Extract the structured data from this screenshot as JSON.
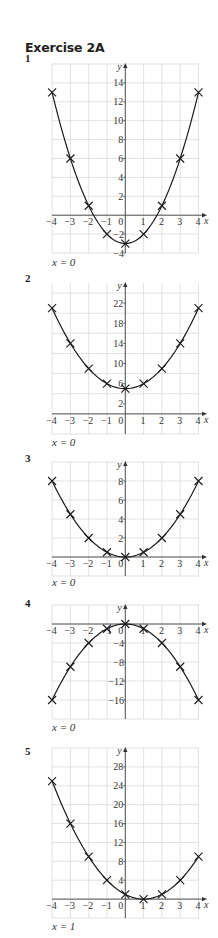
{
  "header": {
    "title": "Exercise 2A"
  },
  "chart_data": [
    {
      "type": "line",
      "number": "1",
      "x": [
        -4,
        -3,
        -2,
        -1,
        0,
        1,
        2,
        3,
        4
      ],
      "values": [
        13,
        6,
        1,
        -2,
        -3,
        -2,
        1,
        6,
        13
      ],
      "xlabel": "x",
      "ylabel": "y",
      "xlim": [
        -4,
        4
      ],
      "ylim": [
        -4,
        16
      ],
      "yticks": [
        -4,
        -2,
        2,
        4,
        6,
        8,
        10,
        12,
        14
      ],
      "xticks": [
        -4,
        -3,
        -2,
        -1,
        0,
        1,
        2,
        3,
        4
      ],
      "grid": true,
      "markers": "x",
      "answer": "x = 0"
    },
    {
      "type": "line",
      "number": "2",
      "x": [
        -4,
        -3,
        -2,
        -1,
        0,
        1,
        2,
        3,
        4
      ],
      "values": [
        21,
        14,
        9,
        6,
        5,
        6,
        9,
        14,
        21
      ],
      "xlabel": "x",
      "ylabel": "y",
      "xlim": [
        -4,
        4
      ],
      "ylim": [
        -4,
        26
      ],
      "yticks": [
        2,
        6,
        10,
        14,
        18,
        22
      ],
      "xticks": [
        -4,
        -3,
        -2,
        -1,
        0,
        1,
        2,
        3,
        4
      ],
      "grid": true,
      "markers": "x",
      "answer": "x = 0"
    },
    {
      "type": "line",
      "number": "3",
      "x": [
        -4,
        -3,
        -2,
        -1,
        0,
        1,
        2,
        3,
        4
      ],
      "values": [
        8,
        4.5,
        2,
        0.5,
        0,
        0.5,
        2,
        4.5,
        8
      ],
      "xlabel": "x",
      "ylabel": "y",
      "xlim": [
        -4,
        4
      ],
      "ylim": [
        -2,
        10
      ],
      "yticks": [
        2,
        4,
        6,
        8
      ],
      "xticks": [
        -4,
        -3,
        -2,
        -1,
        0,
        1,
        2,
        3,
        4
      ],
      "grid": true,
      "markers": "x",
      "answer": "x = 0"
    },
    {
      "type": "line",
      "number": "4",
      "x": [
        -4,
        -3,
        -2,
        -1,
        0,
        1,
        2,
        3,
        4
      ],
      "values": [
        -16,
        -9,
        -4,
        -1,
        0,
        -1,
        -4,
        -9,
        -16
      ],
      "xlabel": "x",
      "ylabel": "y",
      "xlim": [
        -4,
        4
      ],
      "ylim": [
        -20,
        4
      ],
      "yticks": [
        -4,
        -8,
        -12,
        -16
      ],
      "xticks": [
        -4,
        -3,
        -2,
        -1,
        0,
        1,
        2,
        3,
        4
      ],
      "grid": true,
      "markers": "x",
      "answer": "x = 0"
    },
    {
      "type": "line",
      "number": "5",
      "x": [
        -4,
        -3,
        -2,
        -1,
        0,
        1,
        2,
        3,
        4
      ],
      "values": [
        25,
        16,
        9,
        4,
        1,
        0,
        1,
        4,
        9
      ],
      "xlabel": "x",
      "ylabel": "y",
      "xlim": [
        -4,
        4
      ],
      "ylim": [
        -4,
        32
      ],
      "yticks": [
        4,
        8,
        12,
        16,
        20,
        24,
        28
      ],
      "xticks": [
        -4,
        -3,
        -2,
        -1,
        0,
        1,
        2,
        3,
        4
      ],
      "grid": true,
      "markers": "x",
      "answer": "x = 1"
    }
  ],
  "layout": [
    {
      "qnum_top": 52,
      "svg_top": 60,
      "svg_h": 200,
      "grid_top": 64,
      "grid_bottom": 253,
      "y_top_val": 16,
      "y_bot_val": -4,
      "answer_top": 256
    },
    {
      "qnum_top": 272,
      "svg_top": 278,
      "svg_h": 162,
      "grid_top": 283,
      "grid_bottom": 434,
      "y_top_val": 26,
      "y_bot_val": -4,
      "answer_top": 436
    },
    {
      "qnum_top": 452,
      "svg_top": 458,
      "svg_h": 122,
      "grid_top": 462,
      "grid_bottom": 576,
      "y_top_val": 10,
      "y_bot_val": -2,
      "answer_top": 576
    },
    {
      "qnum_top": 597,
      "svg_top": 600,
      "svg_h": 124,
      "grid_top": 605,
      "grid_bottom": 719,
      "y_top_val": 4,
      "y_bot_val": -20,
      "answer_top": 721
    },
    {
      "qnum_top": 745,
      "svg_top": 744,
      "svg_h": 180,
      "grid_top": 748,
      "grid_bottom": 918,
      "y_top_val": 32,
      "y_bot_val": -4,
      "answer_top": 920
    }
  ]
}
